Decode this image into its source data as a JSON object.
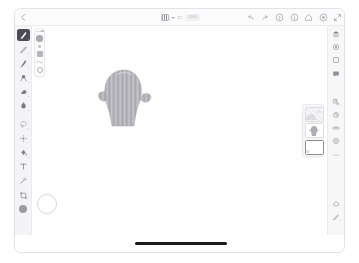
{
  "app": {
    "name": "Adobe Fresco",
    "accent": "#4b4b52",
    "canvas_background": "#ffffff",
    "panel_background": "#f4f4f6"
  },
  "topbar": {
    "back_label": "Back",
    "back_icon": "chevron-left-icon",
    "document_thumb_label": "Document",
    "document_caret_icon": "chevron-down-icon",
    "layer_menu_icon": "overflow-dots-icon",
    "zoom_label": "100%",
    "right_actions": [
      {
        "icon": "undo-icon",
        "label": "Undo"
      },
      {
        "icon": "redo-icon",
        "label": "Redo"
      },
      {
        "icon": "help-circle-icon",
        "label": "Help"
      },
      {
        "icon": "info-circle-icon",
        "label": "Info"
      },
      {
        "icon": "home-icon",
        "label": "Home"
      },
      {
        "icon": "settings-circle-icon",
        "label": "Settings"
      },
      {
        "icon": "fullscreen-icon",
        "label": "Full Screen"
      }
    ]
  },
  "tools": [
    {
      "name": "pixel-brush-tool",
      "label": "Pixel Brush",
      "icon": "pixel-brush-icon",
      "selected": true
    },
    {
      "name": "pencil-tool",
      "label": "Pencil",
      "icon": "pencil-icon",
      "selected": false
    },
    {
      "name": "live-brush-tool",
      "label": "Live Brush",
      "icon": "live-brush-icon",
      "selected": false
    },
    {
      "name": "vector-brush-tool",
      "label": "Vector Brush",
      "icon": "vector-brush-icon",
      "selected": false
    },
    {
      "name": "eraser-tool",
      "label": "Eraser",
      "icon": "eraser-icon",
      "selected": false
    },
    {
      "name": "smudge-tool",
      "label": "Smudge",
      "icon": "smudge-icon",
      "selected": false
    },
    {
      "name": "lasso-select-tool",
      "label": "Selection",
      "icon": "lasso-icon",
      "selected": false
    },
    {
      "name": "transform-tool",
      "label": "Transform",
      "icon": "transform-icon",
      "selected": false
    },
    {
      "name": "fill-tool",
      "label": "Fill",
      "icon": "paint-bucket-icon",
      "selected": false
    },
    {
      "name": "text-tool",
      "label": "Text",
      "icon": "text-icon",
      "selected": false
    },
    {
      "name": "eyedropper-tool",
      "label": "Eyedropper",
      "icon": "eyedropper-icon",
      "selected": false
    },
    {
      "name": "crop-tool",
      "label": "Crop",
      "icon": "crop-icon",
      "selected": false
    }
  ],
  "color_swatch": {
    "label": "Current Color",
    "value": "#9b9ba1"
  },
  "brush_panel": {
    "size_label": "Size",
    "size_value": "",
    "flow_label": "Flow",
    "flow_value": "",
    "smoothing_label": "Smoothing",
    "blend_label": "Blend Mode",
    "opacity_label": "Opacity"
  },
  "canvas": {
    "artwork_label": "Sketch",
    "artwork_color": "#a8a8ae",
    "brush_cursor_label": "Brush Cursor"
  },
  "layers_panel": {
    "title": "Layers",
    "layers": [
      {
        "name": "layer-photo",
        "label": "Layer 3",
        "thumb": "photo",
        "active": false,
        "has_badge": true
      },
      {
        "name": "layer-sketch",
        "label": "Layer 2",
        "thumb": "art",
        "active": false,
        "has_badge": false
      },
      {
        "name": "layer-blank",
        "label": "Layer 1",
        "thumb": "blank",
        "active": true,
        "has_badge": true
      }
    ]
  },
  "right_rail": [
    {
      "name": "layers-button",
      "label": "Layers",
      "icon": "layers-icon",
      "group": 0
    },
    {
      "name": "color-button",
      "label": "Color",
      "icon": "color-wheel-icon",
      "group": 0
    },
    {
      "name": "shape-button",
      "label": "Shapes",
      "icon": "square-icon",
      "group": 0
    },
    {
      "name": "comment-button",
      "label": "Comments",
      "icon": "comment-icon",
      "group": 0
    },
    {
      "name": "publish-button",
      "label": "Publish",
      "icon": "publish-icon",
      "group": 1
    },
    {
      "name": "timelapse-button",
      "label": "Time-lapse",
      "icon": "timelapse-icon",
      "group": 1
    },
    {
      "name": "ruler-button",
      "label": "Ruler",
      "icon": "ruler-icon",
      "group": 1
    },
    {
      "name": "reference-button",
      "label": "Reference",
      "icon": "reference-icon",
      "group": 1
    },
    {
      "name": "more-button",
      "label": "More",
      "icon": "more-horizontal-icon",
      "group": 1
    },
    {
      "name": "cloud-button",
      "label": "Cloud Documents",
      "icon": "cloud-icon",
      "group": 2
    },
    {
      "name": "touch-shortcut",
      "label": "Touch Shortcut",
      "icon": "pen-tip-icon",
      "group": 2
    }
  ],
  "system": {
    "home_indicator_label": "Home Indicator"
  }
}
